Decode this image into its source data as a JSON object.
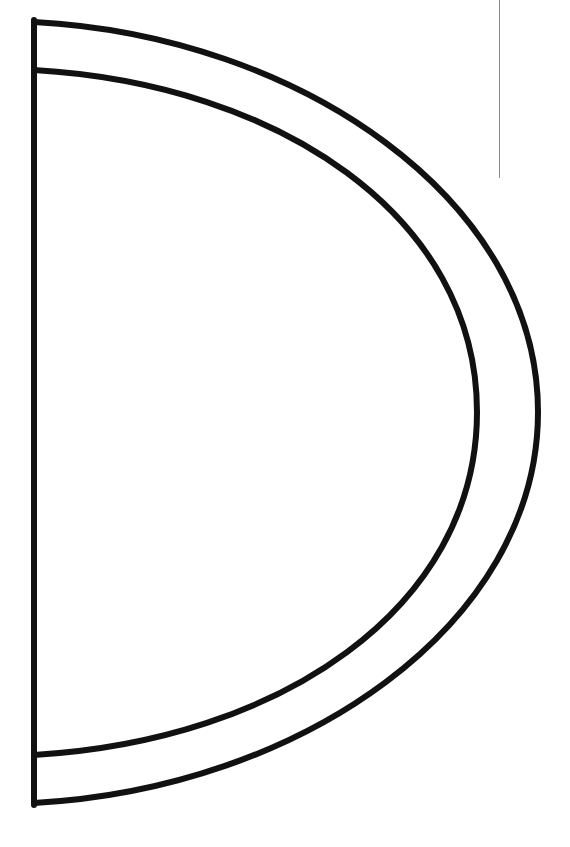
{
  "page": {
    "width": 570,
    "height": 847,
    "background_color": "#ffffff",
    "title": ""
  },
  "axis": {
    "label": "number of seeds",
    "label_rotation_deg": 90,
    "label_color": "#2b2b2b",
    "line_color": "#8b8b8b",
    "line_x": 499,
    "line_y_start": 0,
    "line_y_end": 178
  },
  "figure": {
    "name": "half-moon-outline",
    "stroke_color": "#111111",
    "fill_color": "#ffffff",
    "outer_arc": {
      "start_x": 34,
      "start_y": 22,
      "end_x": 34,
      "end_y": 803,
      "max_x": 538,
      "stroke_width": 6
    },
    "inner_arc": {
      "start_x": 34,
      "start_y": 70,
      "end_x": 34,
      "end_y": 755,
      "max_x": 477,
      "stroke_width": 6
    },
    "left_edge": {
      "x": 34,
      "y_start": 22,
      "y_end": 805,
      "stroke_width": 6
    }
  }
}
